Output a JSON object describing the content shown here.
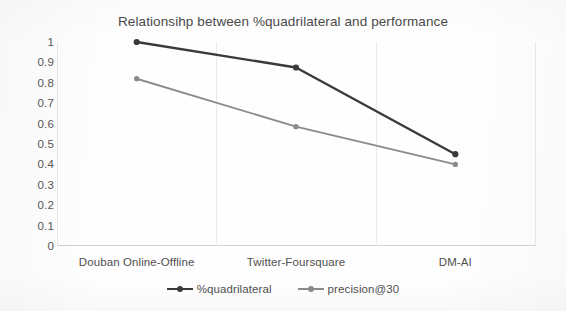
{
  "chart_data": {
    "type": "line",
    "title": "Relationsihp between %quadrilateral and performance",
    "xlabel": "",
    "ylabel": "",
    "categories": [
      "Douban Online-Offline",
      "Twitter-Foursquare",
      "DM-AI"
    ],
    "series": [
      {
        "name": "%quadrilateral",
        "color": "#3a3a3a",
        "values": [
          1.0,
          0.875,
          0.45
        ]
      },
      {
        "name": "precision@30",
        "color": "#8b8b8b",
        "values": [
          0.82,
          0.585,
          0.4
        ]
      }
    ],
    "ylim": [
      0,
      1
    ],
    "ytick_labels": [
      "1",
      "0.9",
      "0.8",
      "0.7",
      "0.6",
      "0.5",
      "0.4",
      "0.3",
      "0.2",
      "0.1",
      "0"
    ],
    "ytick_values": [
      1,
      0.9,
      0.8,
      0.7,
      0.6,
      0.5,
      0.4,
      0.3,
      0.2,
      0.1,
      0
    ],
    "grid": "vertical-only",
    "legend_position": "bottom",
    "markers": "round",
    "background": "#ffffff"
  }
}
